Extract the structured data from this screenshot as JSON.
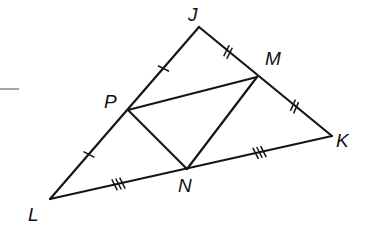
{
  "diagram": {
    "type": "triangle-midsegment",
    "points": {
      "J": {
        "label": "J",
        "x": 199,
        "y": 27,
        "lx": 188,
        "ly": 21
      },
      "M": {
        "label": "M",
        "x": 257,
        "y": 77,
        "lx": 265,
        "ly": 65
      },
      "K": {
        "label": "K",
        "x": 332,
        "y": 136,
        "lx": 336,
        "ly": 147
      },
      "P": {
        "label": "P",
        "x": 128,
        "y": 110,
        "lx": 104,
        "ly": 108
      },
      "N": {
        "label": "N",
        "x": 187,
        "y": 169,
        "lx": 178,
        "ly": 192
      },
      "L": {
        "label": "L",
        "x": 50,
        "y": 199,
        "lx": 28,
        "ly": 221
      }
    },
    "segments": [
      {
        "from": "J",
        "to": "K",
        "name": "side-JK"
      },
      {
        "from": "K",
        "to": "L",
        "name": "side-KL"
      },
      {
        "from": "L",
        "to": "J",
        "name": "side-LJ"
      },
      {
        "from": "P",
        "to": "M",
        "name": "midsegment-PM"
      },
      {
        "from": "M",
        "to": "N",
        "name": "midsegment-MN"
      },
      {
        "from": "N",
        "to": "P",
        "name": "midsegment-NP"
      }
    ],
    "tick_marks": [
      {
        "segment": "JP",
        "count": 1
      },
      {
        "segment": "PL",
        "count": 1
      },
      {
        "segment": "JM",
        "count": 2
      },
      {
        "segment": "MK",
        "count": 2
      },
      {
        "segment": "LN",
        "count": 3
      },
      {
        "segment": "NK",
        "count": 3
      }
    ],
    "stray_line": {
      "x1": 0,
      "y1": 89,
      "x2": 19,
      "y2": 89,
      "color": "#8a8a8a"
    }
  }
}
